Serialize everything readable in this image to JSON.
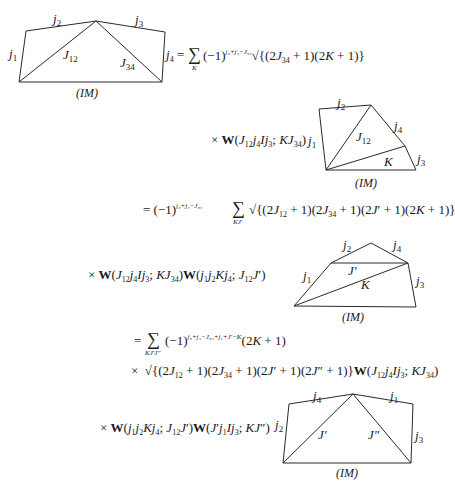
{
  "document": {
    "type": "recoupling-derivation",
    "lines": [
      {
        "id": "line1",
        "text": "= Σ_K (−1)^{j3+j4−J34} √{(2J34+1)(2K+1)}",
        "sum_index": "K",
        "phase": "j₃+j₄−J₃₄",
        "root": "√{(2J₃₄ + 1)(2K + 1)}"
      },
      {
        "id": "line2",
        "text": "× W(J12 j4 I j3; K J34)"
      },
      {
        "id": "line3",
        "text": "= (−1)^{j3+j4−J34} Σ_{KJ'} √{(2J12+1)(2J34+1)(2J'+1)(2K+1)}",
        "sum_index": "KJ′",
        "phase": "j₃+j₄−J₃₄",
        "root": "√{(2J₁₂ + 1)(2J₃₄ + 1)(2J′ + 1)(2K + 1)}"
      },
      {
        "id": "line4",
        "text": "× W(J12 j4 I j3; K J34) W(j1 j2 K j4; J12 J')"
      },
      {
        "id": "line5",
        "text": "= Σ_{KJ'J''} (−1)^{j3+j4−J34+j1+J'−K} (2K+1)",
        "sum_index": "KJ′J″",
        "phase": "j₃+j₄−J₃₄+j₁+J′−K"
      },
      {
        "id": "line6",
        "text": "× √{(2J12+1)(2J34+1)(2J'+1)(2J''+1)} W(J12 j4 I j3; K J34)"
      },
      {
        "id": "line7",
        "text": "× W(j1 j2 K j4; J12 J') W(J' j1 I j3; K J'')"
      }
    ],
    "diagrams": [
      {
        "id": "diagram1",
        "edges": [
          "j1",
          "j2",
          "j3",
          "j4",
          "J12",
          "J34"
        ],
        "base_label": "(IM)"
      },
      {
        "id": "diagram2",
        "edges": [
          "j1",
          "j2",
          "j4",
          "j3",
          "J12",
          "K"
        ],
        "base_label": "(IM)"
      },
      {
        "id": "diagram3",
        "edges": [
          "j1",
          "j2",
          "j4",
          "j3",
          "J'",
          "K"
        ],
        "base_label": "(IM)"
      },
      {
        "id": "diagram4",
        "edges": [
          "j2",
          "j4",
          "j1",
          "j3",
          "J'",
          "J''"
        ],
        "base_label": "(IM)"
      }
    ]
  }
}
